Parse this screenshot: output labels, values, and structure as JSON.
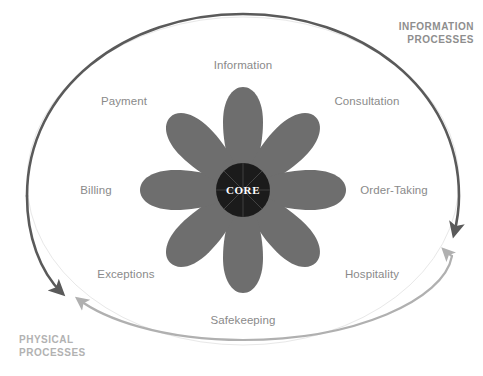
{
  "diagram": {
    "core": {
      "label": "CORE",
      "fill": "#1b1b1b",
      "text_color": "#ffffff"
    },
    "petals": {
      "fill": "#6e6e6e",
      "count": 8,
      "items": [
        {
          "label": "Information",
          "angle_deg": 270,
          "category": "information"
        },
        {
          "label": "Consultation",
          "angle_deg": 315,
          "category": "information"
        },
        {
          "label": "Order-Taking",
          "angle_deg": 0,
          "category": "information"
        },
        {
          "label": "Hospitality",
          "angle_deg": 45,
          "category": "physical"
        },
        {
          "label": "Safekeeping",
          "angle_deg": 90,
          "category": "physical"
        },
        {
          "label": "Exceptions",
          "angle_deg": 135,
          "category": "physical"
        },
        {
          "label": "Billing",
          "angle_deg": 180,
          "category": "information"
        },
        {
          "label": "Payment",
          "angle_deg": 225,
          "category": "information"
        }
      ]
    },
    "labels": {
      "information": "Information",
      "consultation": "Consultation",
      "order_taking": "Order-Taking",
      "hospitality": "Hospitality",
      "safekeeping": "Safekeeping",
      "exceptions": "Exceptions",
      "billing": "Billing",
      "payment": "Payment",
      "label_color": "#8a8a8a"
    },
    "process_labels": {
      "information_line1": "INFORMATION",
      "information_line2": "PROCESSES",
      "information_color": "#8e8e8e",
      "physical_line1": "PHYSICAL",
      "physical_line2": "PROCESSES",
      "physical_color": "#b2b2b2"
    },
    "arrows": {
      "information_arc_color": "#5a5a5a",
      "physical_arc_color": "#b0b0b0",
      "outline_ellipse_color": "#e2e2e2"
    }
  }
}
